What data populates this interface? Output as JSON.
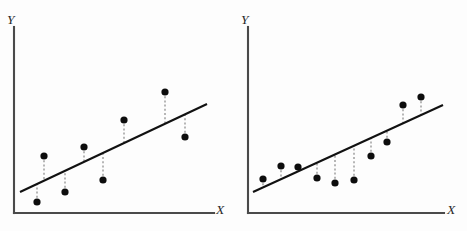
{
  "figure": {
    "panel_count": 2,
    "colors": {
      "dot": "#0d0d0d",
      "fit_line": "#111111",
      "residual": "#8d8d8d",
      "axis": "#4a4a4a",
      "background": "#fdfdfd"
    }
  },
  "chart_data": [
    {
      "type": "scatter",
      "id": "left-panel",
      "title": "",
      "xlabel": "X",
      "ylabel": "Y",
      "xlim": [
        0,
        100
      ],
      "ylim": [
        0,
        100
      ],
      "grid": false,
      "legend": null,
      "axis_labels_italic": true,
      "fit_line": {
        "label": "regression line",
        "x_start": 3.5,
        "y_start": 11.6,
        "x_end": 107.0,
        "y_end": 59.5
      },
      "points": [
        {
          "x": 16.6,
          "y": 31.0,
          "fit_y": 18.5,
          "residual": 12.5,
          "sign": "positive"
        },
        {
          "x": 13.0,
          "y": 9.0,
          "fit_y": 16.8,
          "residual": -7.8,
          "sign": "negative"
        },
        {
          "x": 39.0,
          "y": 36.9,
          "fit_y": 28.8,
          "residual": 8.1,
          "sign": "positive"
        },
        {
          "x": 28.8,
          "y": 12.1,
          "fit_y": 24.1,
          "residual": -12.0,
          "sign": "negative"
        },
        {
          "x": 61.5,
          "y": 53.3,
          "fit_y": 39.2,
          "residual": 14.1,
          "sign": "positive"
        },
        {
          "x": 50.0,
          "y": 18.5,
          "fit_y": 33.9,
          "residual": -15.4,
          "sign": "negative"
        },
        {
          "x": 84.0,
          "y": 65.5,
          "fit_y": 49.7,
          "residual": 15.8,
          "sign": "positive"
        },
        {
          "x": 95.0,
          "y": 45.0,
          "fit_y": 54.8,
          "residual": -9.8,
          "sign": "negative"
        }
      ]
    },
    {
      "type": "scatter",
      "id": "right-panel",
      "title": "",
      "xlabel": "X",
      "ylabel": "Y",
      "xlim": [
        0,
        100
      ],
      "ylim": [
        0,
        100
      ],
      "grid": false,
      "legend": null,
      "axis_labels_italic": true,
      "fit_line": {
        "label": "regression line",
        "x_start": 2.6,
        "y_start": 11.5,
        "x_end": 101.0,
        "y_end": 58.5
      },
      "points": [
        {
          "x": 7.5,
          "y": 18.5,
          "fit_y": 13.8,
          "residual": 4.7,
          "sign": "positive"
        },
        {
          "x": 17.5,
          "y": 25.0,
          "fit_y": 18.6,
          "residual": 6.4,
          "sign": "positive"
        },
        {
          "x": 26.5,
          "y": 24.5,
          "fit_y": 22.9,
          "residual": 1.6,
          "sign": "positive"
        },
        {
          "x": 36.0,
          "y": 18.6,
          "fit_y": 27.4,
          "residual": -8.8,
          "sign": "negative"
        },
        {
          "x": 45.5,
          "y": 15.8,
          "fit_y": 31.9,
          "residual": -16.1,
          "sign": "negative"
        },
        {
          "x": 55.5,
          "y": 17.3,
          "fit_y": 36.7,
          "residual": -19.4,
          "sign": "negative"
        },
        {
          "x": 64.5,
          "y": 30.0,
          "fit_y": 41.0,
          "residual": -11.0,
          "sign": "negative"
        },
        {
          "x": 73.0,
          "y": 37.5,
          "fit_y": 45.0,
          "residual": -7.5,
          "sign": "negative"
        },
        {
          "x": 81.5,
          "y": 57.0,
          "fit_y": 49.1,
          "residual": 7.9,
          "sign": "positive"
        },
        {
          "x": 90.5,
          "y": 61.5,
          "fit_y": 53.3,
          "residual": 8.2,
          "sign": "positive"
        }
      ]
    }
  ],
  "panels": [
    {
      "name": "left-panel",
      "y_axis_label": "Y",
      "x_axis_label": "X",
      "y_label_pos": {
        "x": 7,
        "y": 24
      },
      "x_label_pos": {
        "x": 216,
        "y": 214
      },
      "axis": {
        "x0": 14,
        "y0": 213,
        "y_top": 27,
        "x_right": 214
      },
      "fit": {
        "x1": 20,
        "y1": 192,
        "x2": 207,
        "y2": 104
      },
      "dots": [
        {
          "cx": 44,
          "cy": 156,
          "fx": 44,
          "fy": 181
        },
        {
          "cx": 37,
          "cy": 202,
          "fx": 37,
          "fy": 184
        },
        {
          "cx": 84,
          "cy": 147,
          "fx": 84,
          "fy": 162
        },
        {
          "cx": 65,
          "cy": 192,
          "fx": 65,
          "fy": 171
        },
        {
          "cx": 124,
          "cy": 120,
          "fx": 124,
          "fy": 143
        },
        {
          "cx": 103,
          "cy": 180,
          "fx": 103,
          "fy": 153
        },
        {
          "cx": 165,
          "cy": 92,
          "fx": 165,
          "fy": 124
        },
        {
          "cx": 185,
          "cy": 137,
          "fx": 185,
          "fy": 114
        }
      ]
    },
    {
      "name": "right-panel",
      "y_axis_label": "Y",
      "x_axis_label": "X",
      "y_label_pos": {
        "x": 8,
        "y": 24
      },
      "x_label_pos": {
        "x": 214,
        "y": 214
      },
      "axis": {
        "x0": 15,
        "y0": 213,
        "y_top": 27,
        "x_right": 211
      },
      "fit": {
        "x1": 20,
        "y1": 192,
        "x2": 210,
        "y2": 105
      },
      "dots": [
        {
          "cx": 30,
          "cy": 179,
          "fx": 30,
          "fy": 188
        },
        {
          "cx": 48,
          "cy": 166,
          "fx": 48,
          "fy": 180
        },
        {
          "cx": 65,
          "cy": 167,
          "fx": 65,
          "fy": 172
        },
        {
          "cx": 84,
          "cy": 178,
          "fx": 84,
          "fy": 163
        },
        {
          "cx": 102,
          "cy": 183,
          "fx": 102,
          "fy": 155
        },
        {
          "cx": 121,
          "cy": 180,
          "fx": 121,
          "fy": 146
        },
        {
          "cx": 138,
          "cy": 156,
          "fx": 138,
          "fy": 138
        },
        {
          "cx": 154,
          "cy": 142,
          "fx": 154,
          "fy": 130
        },
        {
          "cx": 170,
          "cy": 105,
          "fx": 170,
          "fy": 123
        },
        {
          "cx": 188,
          "cy": 97,
          "fx": 188,
          "fy": 115
        }
      ]
    }
  ]
}
